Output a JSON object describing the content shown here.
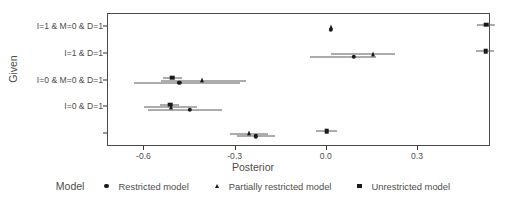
{
  "chart_data": {
    "type": "scatter",
    "title": "",
    "xlabel": "Posterior",
    "ylabel": "Given",
    "xlim": [
      -0.72,
      0.54
    ],
    "xticks": [
      -0.6,
      -0.3,
      0.0,
      0.3
    ],
    "xticklabels": [
      "-0.6",
      "-0.3",
      "0.0",
      "0.3"
    ],
    "grid": false,
    "legend_title": "Model",
    "legend_position": "bottom",
    "categories": [
      "I=1 & M=0 & D=1",
      "I=1 & D=1",
      "I=0 & M=0 & D=1",
      "I=0 & D=1",
      ""
    ],
    "series": [
      {
        "name": "Restricted model",
        "marker": "circle",
        "points": [
          {
            "category": "I=1 & M=0 & D=1",
            "value": 0.012,
            "lower": 0.012,
            "upper": 0.012
          },
          {
            "category": "I=1 & D=1",
            "value": 0.088,
            "lower": -0.055,
            "upper": 0.162
          },
          {
            "category": "I=0 & M=0 & D=1",
            "value": -0.485,
            "lower": -0.635,
            "upper": -0.285
          },
          {
            "category": "I=0 & D=1",
            "value": -0.45,
            "lower": -0.59,
            "upper": -0.345
          },
          {
            "category": "",
            "value": -0.233,
            "lower": -0.295,
            "upper": -0.172
          }
        ]
      },
      {
        "name": "Partially restricted model",
        "marker": "triangle",
        "points": [
          {
            "category": "I=1 & M=0 & D=1",
            "value": 0.013,
            "lower": 0.013,
            "upper": 0.013
          },
          {
            "category": "I=1 & D=1",
            "value": 0.152,
            "lower": 0.012,
            "upper": 0.225
          },
          {
            "category": "I=0 & M=0 & D=1",
            "value": -0.41,
            "lower": -0.545,
            "upper": -0.265
          },
          {
            "category": "I=0 & D=1",
            "value": -0.512,
            "lower": -0.6,
            "upper": -0.428
          },
          {
            "category": "",
            "value": -0.255,
            "lower": -0.32,
            "upper": -0.195
          }
        ]
      },
      {
        "name": "Unrestricted model",
        "marker": "square",
        "points": [
          {
            "category": "I=1 & M=0 & D=1",
            "value": 0.525,
            "lower": 0.495,
            "upper": 0.552
          },
          {
            "category": "I=1 & D=1",
            "value": 0.522,
            "lower": 0.492,
            "upper": 0.55
          },
          {
            "category": "I=0 & M=0 & D=1",
            "value": -0.508,
            "lower": -0.54,
            "upper": -0.478
          },
          {
            "category": "I=0 & D=1",
            "value": -0.515,
            "lower": -0.548,
            "upper": -0.485
          },
          {
            "category": "",
            "value": 0.0,
            "lower": -0.035,
            "upper": 0.032
          }
        ]
      }
    ]
  },
  "axes": {
    "x_title": "Posterior",
    "y_title": "Given",
    "x_tick_labels": [
      "-0.6",
      "-0.3",
      "0.0",
      "0.3"
    ],
    "y_tick_labels": [
      "I=1 & M=0 & D=1",
      "I=1 & D=1",
      "I=0 & M=0 & D=1",
      "I=0 & D=1",
      ""
    ]
  },
  "legend": {
    "title": "Model",
    "items": [
      {
        "label": "Restricted model",
        "marker": "circle-marker"
      },
      {
        "label": "Partially restricted model",
        "marker": "triangle-marker"
      },
      {
        "label": "Unrestricted model",
        "marker": "square-marker"
      }
    ]
  }
}
